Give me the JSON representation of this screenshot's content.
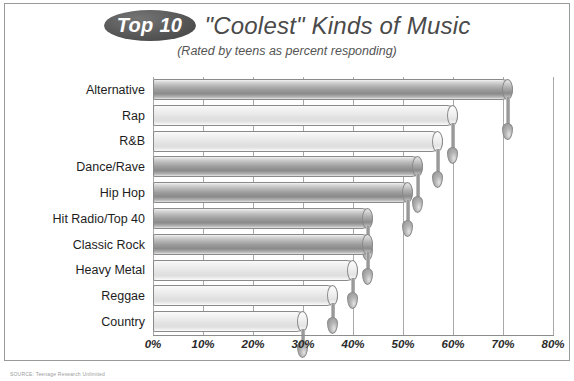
{
  "title": {
    "badge_label": "Top 10",
    "main": "\"Coolest\" Kinds of Music",
    "subtitle": "(Rated by teens as percent responding)"
  },
  "source_note": "SOURCE: Teenage Research Unlimited",
  "colors": {
    "panel_border": "#9a9a9a",
    "gridline": "#a9a9a9",
    "badge_fill": "#5b5b5b",
    "title_text": "#4a4a4a",
    "bar_dark": "#9d9d9d",
    "bar_light": "#e6e6e6",
    "drip": "#8d8d8d"
  },
  "chart_data": {
    "type": "bar",
    "orientation": "horizontal",
    "title": "\"Coolest\" Kinds of Music",
    "subtitle": "(Rated by teens as percent responding)",
    "xlabel": "",
    "ylabel": "",
    "xlim": [
      0,
      80
    ],
    "grid": true,
    "legend": null,
    "tick_labels": [
      "0%",
      "10%",
      "20%",
      "30%",
      "40%",
      "50%",
      "60%",
      "70%",
      "80%"
    ],
    "tick_values": [
      0,
      10,
      20,
      30,
      40,
      50,
      60,
      70,
      80
    ],
    "unit": "%",
    "categories": [
      "Alternative",
      "Rap",
      "R&B",
      "Dance/Rave",
      "Hip Hop",
      "Hit Radio/Top 40",
      "Classic Rock",
      "Heavy Metal",
      "Reggae",
      "Country"
    ],
    "values": [
      72,
      61,
      58,
      54,
      52,
      44,
      44,
      41,
      37,
      31
    ],
    "bars": [
      {
        "label": "Alternative",
        "value": 72,
        "shade": "dark"
      },
      {
        "label": "Rap",
        "value": 61,
        "shade": "light"
      },
      {
        "label": "R&B",
        "value": 58,
        "shade": "light"
      },
      {
        "label": "Dance/Rave",
        "value": 54,
        "shade": "dark"
      },
      {
        "label": "Hip Hop",
        "value": 52,
        "shade": "dark"
      },
      {
        "label": "Hit Radio/Top 40",
        "value": 44,
        "shade": "dark"
      },
      {
        "label": "Classic Rock",
        "value": 44,
        "shade": "dark"
      },
      {
        "label": "Heavy Metal",
        "value": 41,
        "shade": "light"
      },
      {
        "label": "Reggae",
        "value": 37,
        "shade": "light"
      },
      {
        "label": "Country",
        "value": 31,
        "shade": "light"
      }
    ]
  }
}
